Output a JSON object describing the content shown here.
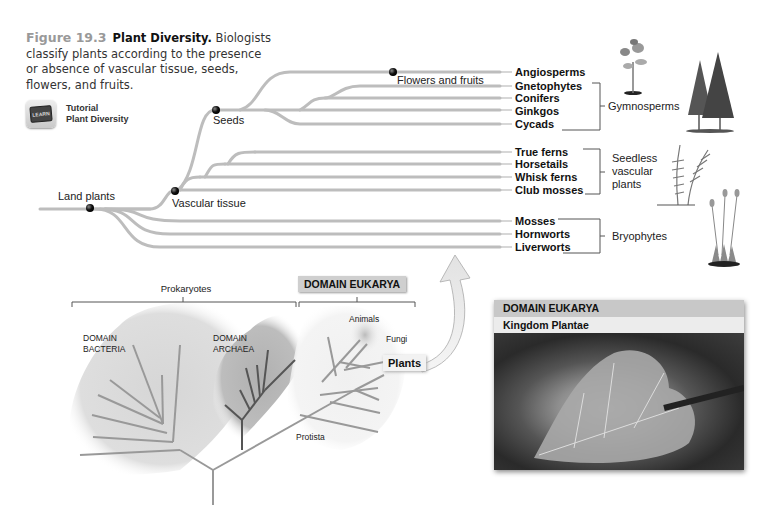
{
  "caption": {
    "figure_number": "Figure 19.3",
    "title": "Plant Diversity.",
    "text": "Biologists classify plants according to the presence or absence of vascular tissue, seeds, flowers, and fruits."
  },
  "tutorial": {
    "icon_label": "LEARN",
    "line1": "Tutorial",
    "line2": "Plant Diversity"
  },
  "tree": {
    "nodes": {
      "land_plants": "Land plants",
      "vascular_tissue": "Vascular tissue",
      "seeds": "Seeds",
      "flowers_fruits": "Flowers and fruits"
    },
    "taxa": [
      "Angiosperms",
      "Gnetophytes",
      "Conifers",
      "Ginkgos",
      "Cycads",
      "True ferns",
      "Horsetails",
      "Whisk ferns",
      "Club mosses",
      "Mosses",
      "Hornworts",
      "Liverworts"
    ],
    "groups": {
      "gymnosperms": "Gymnosperms",
      "seedless_vascular": [
        "Seedless",
        "vascular",
        "plants"
      ],
      "bryophytes": "Bryophytes"
    }
  },
  "tree_of_life": {
    "prokaryotes": "Prokaryotes",
    "domain_eukarya": "DOMAIN EUKARYA",
    "bacteria": [
      "DOMAIN",
      "BACTERIA"
    ],
    "archaea": [
      "DOMAIN",
      "ARCHAEA"
    ],
    "animals": "Animals",
    "fungi": "Fungi",
    "plants": "Plants",
    "protista": "Protista"
  },
  "photo_panel": {
    "header1": "DOMAIN EUKARYA",
    "header2": "Kingdom Plantae"
  },
  "colors": {
    "branch": "#bdbdbd",
    "bacteria_blob": "#dcdcdc",
    "archaea_blob": "#b9b9b9",
    "archaea_branch": "#555555"
  }
}
